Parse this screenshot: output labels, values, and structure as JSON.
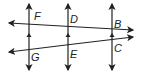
{
  "diagram": {
    "stroke_color": "#222222",
    "points": [
      {
        "label": "F",
        "x": 36,
        "y": 20
      },
      {
        "label": "D",
        "x": 73,
        "y": 24
      },
      {
        "label": "B",
        "x": 116,
        "y": 28
      },
      {
        "label": "G",
        "x": 33,
        "y": 60
      },
      {
        "label": "E",
        "x": 72,
        "y": 57
      },
      {
        "label": "C",
        "x": 116,
        "y": 52
      }
    ],
    "vertical_lines": [
      {
        "name": "line-left",
        "x": 29
      },
      {
        "name": "line-middle",
        "x": 68
      },
      {
        "name": "line-right",
        "x": 112
      }
    ],
    "transversals": [
      {
        "name": "transversal-top",
        "x1": 8,
        "y1": 23,
        "x2": 133,
        "y2": 30
      },
      {
        "name": "transversal-bottom",
        "x1": 8,
        "y1": 52,
        "x2": 133,
        "y2": 37
      }
    ],
    "parallel_marker": "arrowhead"
  }
}
